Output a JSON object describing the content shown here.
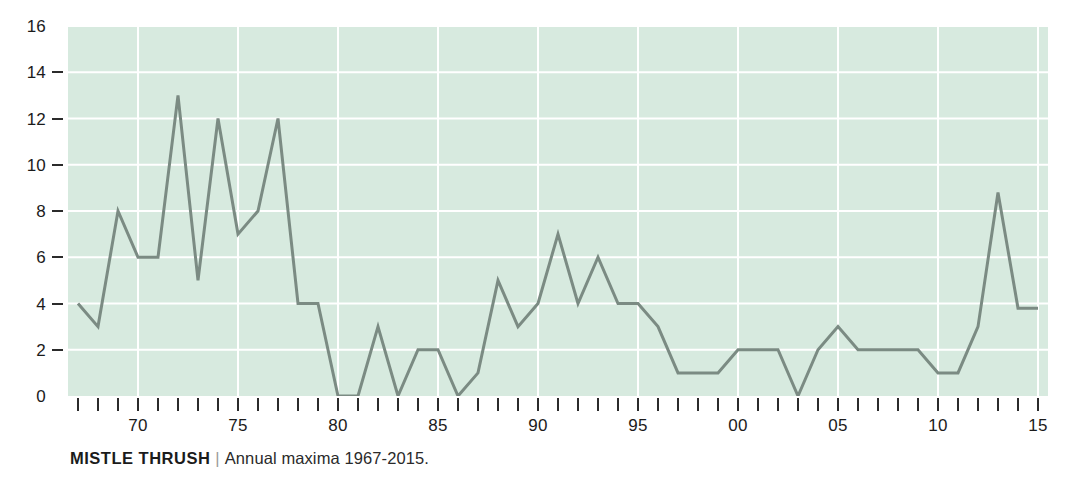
{
  "caption": {
    "species": "MISTLE THRUSH",
    "separator": "|",
    "description": "Annual maxima 1967-2015."
  },
  "colors": {
    "plot_background": "#d7eadf",
    "gridline": "#ffffff",
    "line": "#7b8b83",
    "text": "#1b1b1b",
    "tick": "#2b2b2b"
  },
  "chart_data": {
    "type": "line",
    "title": "MISTLE THRUSH",
    "subtitle": "Annual maxima 1967-2015.",
    "xlabel": "",
    "ylabel": "",
    "xlim": [
      1966.5,
      2015.5
    ],
    "ylim": [
      0,
      16
    ],
    "grid": true,
    "legend": "none",
    "y_ticks": [
      0,
      2,
      4,
      6,
      8,
      10,
      12,
      14,
      16
    ],
    "y_tick_labels": [
      "0",
      "2",
      "4",
      "6",
      "8",
      "10",
      "12",
      "14",
      "16"
    ],
    "x_tick_years": [
      1967,
      1968,
      1969,
      1970,
      1971,
      1972,
      1973,
      1974,
      1975,
      1976,
      1977,
      1978,
      1979,
      1980,
      1981,
      1982,
      1983,
      1984,
      1985,
      1986,
      1987,
      1988,
      1989,
      1990,
      1991,
      1992,
      1993,
      1994,
      1995,
      1996,
      1997,
      1998,
      1999,
      2000,
      2001,
      2002,
      2003,
      2004,
      2005,
      2006,
      2007,
      2008,
      2009,
      2010,
      2011,
      2012,
      2013,
      2014,
      2015
    ],
    "x_labeled_ticks": [
      {
        "year": 1970,
        "label": "70"
      },
      {
        "year": 1975,
        "label": "75"
      },
      {
        "year": 1980,
        "label": "80"
      },
      {
        "year": 1985,
        "label": "85"
      },
      {
        "year": 1990,
        "label": "90"
      },
      {
        "year": 1995,
        "label": "95"
      },
      {
        "year": 2000,
        "label": "00"
      },
      {
        "year": 2005,
        "label": "05"
      },
      {
        "year": 2010,
        "label": "10"
      },
      {
        "year": 2015,
        "label": "15"
      }
    ],
    "series": [
      {
        "name": "Annual maxima",
        "x": [
          1967,
          1968,
          1969,
          1970,
          1971,
          1972,
          1973,
          1974,
          1975,
          1976,
          1977,
          1978,
          1979,
          1980,
          1981,
          1982,
          1983,
          1984,
          1985,
          1986,
          1987,
          1988,
          1989,
          1990,
          1991,
          1992,
          1993,
          1994,
          1995,
          1996,
          1997,
          1998,
          1999,
          2000,
          2001,
          2002,
          2003,
          2004,
          2005,
          2006,
          2007,
          2008,
          2009,
          2010,
          2011,
          2012,
          2013,
          2014,
          2015
        ],
        "values": [
          4,
          3,
          8,
          6,
          6,
          13,
          5,
          12,
          7,
          8,
          12,
          4,
          4,
          0,
          0,
          3,
          0,
          2,
          2,
          0,
          1,
          5,
          3,
          4,
          7,
          4,
          6,
          4,
          4,
          3,
          1,
          1,
          1,
          2,
          2,
          2,
          0,
          2,
          3,
          2,
          2,
          2,
          2,
          1,
          1,
          3,
          8.8,
          3.8,
          3.8
        ]
      }
    ]
  }
}
